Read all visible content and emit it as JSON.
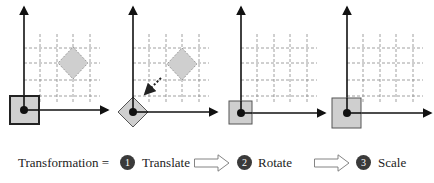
{
  "panels": [
    {
      "id": "initial",
      "has_target_diamond": true,
      "origin_shape": "square",
      "square_size": 28,
      "thick_border": true
    },
    {
      "id": "translate",
      "has_target_diamond": true,
      "origin_shape": "diamond",
      "dotted_arrow": true
    },
    {
      "id": "rotate",
      "origin_shape": "square",
      "square_size": 23
    },
    {
      "id": "scale",
      "origin_shape": "square",
      "square_size": 29
    }
  ],
  "caption": {
    "label": "Transformation =",
    "steps": [
      {
        "number": "1",
        "name": "Translate"
      },
      {
        "number": "2",
        "name": "Rotate"
      },
      {
        "number": "3",
        "name": "Scale"
      }
    ]
  },
  "colors": {
    "shape_fill": "#cfcfcf",
    "axis": "#111111",
    "grid": "#888888",
    "badge": "#3a3a3a"
  }
}
